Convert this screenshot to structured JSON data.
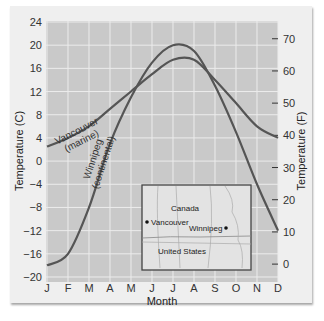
{
  "chart_data": {
    "type": "line",
    "title": "",
    "xlabel": "Month",
    "ylabel": "Temperature (C)",
    "ylabel_right": "Temperature (F)",
    "categories": [
      "J",
      "F",
      "M",
      "A",
      "M",
      "J",
      "J",
      "A",
      "S",
      "O",
      "N",
      "D"
    ],
    "ylim": [
      -20,
      24
    ],
    "yticks": [
      24,
      20,
      16,
      12,
      8,
      4,
      0,
      -4,
      -8,
      -12,
      -16,
      -20
    ],
    "ylim_right": [
      0,
      70
    ],
    "yticks_right": [
      70,
      60,
      50,
      40,
      30,
      20,
      10,
      0
    ],
    "grid": true,
    "series": [
      {
        "name": "Vancouver (marine)",
        "values": [
          2.5,
          4,
          6,
          9,
          12,
          15,
          17.5,
          17.5,
          14,
          10,
          6,
          4
        ]
      },
      {
        "name": "Winnipeg (continental)",
        "values": [
          -18,
          -16,
          -8,
          3,
          11,
          17,
          20,
          19,
          13,
          5,
          -4,
          -12
        ]
      }
    ],
    "annotations": [
      {
        "text": "Vancouver",
        "subtext": "(marine)"
      },
      {
        "text": "Winnipeg",
        "subtext": "(continental)"
      }
    ],
    "inset_map": {
      "labels": [
        "Canada",
        "United States"
      ],
      "cities": [
        "Vancouver",
        "Winnipeg"
      ]
    }
  },
  "labels": {
    "y_left_title": "Temperature (C)",
    "y_right_title": "Temperature (F)",
    "x_title": "Month",
    "vancouver_name": "Vancouver",
    "vancouver_type": "(marine)",
    "winnipeg_name": "Winnipeg",
    "winnipeg_type": "(continental)",
    "map_canada": "Canada",
    "map_us": "United States",
    "map_vancouver": "Vancouver",
    "map_winnipeg": "Winnipeg"
  },
  "colors": {
    "plot_bg": "#c9c9c9",
    "grid": "#ececec",
    "curve": "#555555",
    "frame_bg": "#efefef",
    "map_bg": "#e3e3e3"
  }
}
